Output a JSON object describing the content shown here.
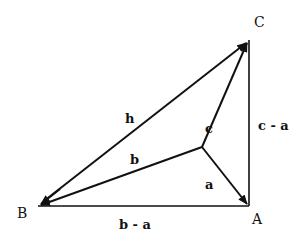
{
  "diagram": {
    "type": "vector-triangle",
    "stroke_color": "#111111",
    "background": "#ffffff",
    "vertices": {
      "A": {
        "label": "A",
        "x": 249,
        "y": 206,
        "label_x": 257,
        "label_y": 224
      },
      "B": {
        "label": "B",
        "x": 38,
        "y": 206,
        "label_x": 22,
        "label_y": 218
      },
      "C": {
        "label": "C",
        "x": 249,
        "y": 40,
        "label_x": 254,
        "label_y": 27
      },
      "O": {
        "label": "",
        "x": 202,
        "y": 147
      }
    },
    "edges": [
      {
        "id": "h",
        "label": "h",
        "from": "B",
        "to": "C",
        "arrow_at": [
          "B",
          "C"
        ],
        "label_x": 130,
        "label_y": 123
      },
      {
        "id": "b",
        "label": "b",
        "from": "O",
        "to": "B",
        "arrow_at": [
          "B"
        ],
        "label_x": 135,
        "label_y": 164
      },
      {
        "id": "c",
        "label": "c",
        "from": "O",
        "to": "C",
        "arrow_at": [
          "C"
        ],
        "label_x": 209,
        "label_y": 133
      },
      {
        "id": "a",
        "label": "a",
        "from": "O",
        "to": "A",
        "arrow_at": [
          "A"
        ],
        "label_x": 209,
        "label_y": 189
      },
      {
        "id": "c-a",
        "label": "c - a",
        "from": "A",
        "to": "C",
        "arrow_at": [],
        "label_x": 258,
        "label_y": 130
      },
      {
        "id": "b-a",
        "label": "b - a",
        "from": "B",
        "to": "A",
        "arrow_at": [],
        "label_x": 120,
        "label_y": 229
      }
    ]
  }
}
